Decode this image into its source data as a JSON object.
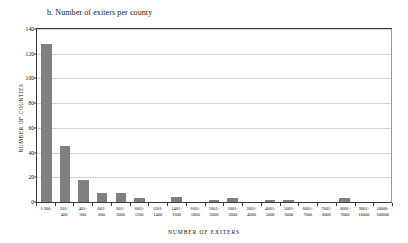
{
  "chart_data": {
    "type": "bar",
    "title": "b. Number of exiters per county",
    "xlabel": "NUMBER OF EXITERS",
    "ylabel": "NUMBER OF COUNTIES",
    "ylim": [
      0,
      140
    ],
    "yticks": [
      0,
      20,
      40,
      60,
      80,
      100,
      120,
      140
    ],
    "grid": true,
    "legend": "none",
    "bar_color": "#808080",
    "gridline_color": "#d3d3d3",
    "axis_color": "#3a3a3a",
    "categories": [
      "1-200",
      "201-400",
      "401-600",
      "601-800",
      "801-1000",
      "1001-1200",
      "1201-1400",
      "1401-1600",
      "1601-1800",
      "1801-2000",
      "2001-3000",
      "3001-4000",
      "4001-5000",
      "5001-6000",
      "6001-7000",
      "7001-8000",
      "8001-9000",
      "9001-10000",
      "10000-100000"
    ],
    "category_lines": [
      [
        "1-200",
        ""
      ],
      [
        "201-",
        "400"
      ],
      [
        "401-",
        "600"
      ],
      [
        "601-",
        "800"
      ],
      [
        "801-",
        "1000"
      ],
      [
        "1001-",
        "1200"
      ],
      [
        "1201-",
        "1400"
      ],
      [
        "1401-",
        "1600"
      ],
      [
        "1601-",
        "1800"
      ],
      [
        "1801-",
        "2000"
      ],
      [
        "2001-",
        "3000"
      ],
      [
        "3001-",
        "4000"
      ],
      [
        "4001-",
        "5000"
      ],
      [
        "5001-",
        "6000"
      ],
      [
        "6001-",
        "7000"
      ],
      [
        "7001-",
        "8000"
      ],
      [
        "8001-",
        "9000"
      ],
      [
        "9001-",
        "10000"
      ],
      [
        "10000-100000",
        ""
      ]
    ],
    "values": [
      128,
      45,
      18,
      7,
      7,
      3,
      0,
      4,
      0,
      2,
      3,
      0,
      2,
      2,
      0,
      0,
      3,
      0,
      0
    ]
  }
}
